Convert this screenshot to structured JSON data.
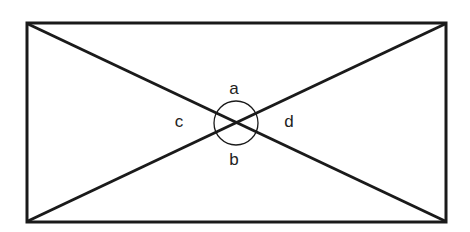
{
  "diagram": {
    "type": "rectangle-with-diagonals",
    "labels": {
      "a": "a",
      "b": "b",
      "c": "c",
      "d": "d"
    },
    "stroke_color": "#1a1a1a",
    "background": "#ffffff"
  }
}
